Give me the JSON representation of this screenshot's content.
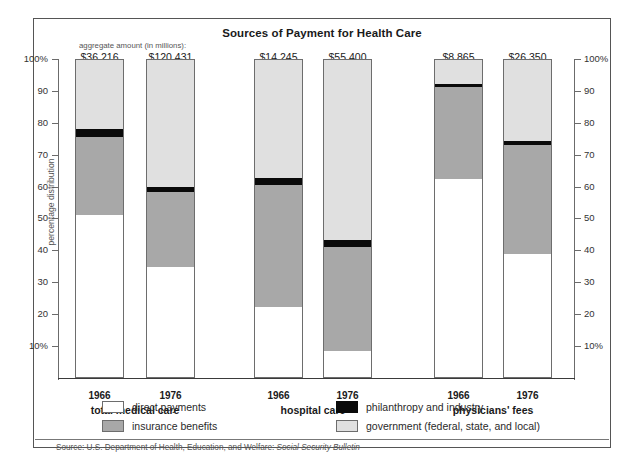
{
  "chart_data": {
    "type": "bar",
    "subtype": "stacked-percentage",
    "title": "Sources of Payment for Health Care",
    "xlabel": "",
    "ylabel": "percentage distribution",
    "ylim": [
      0,
      100
    ],
    "y_ticks": [
      "100%",
      "90",
      "80",
      "70",
      "60",
      "50",
      "40",
      "30",
      "20",
      "10%"
    ],
    "y_tick_values": [
      100,
      90,
      80,
      70,
      60,
      50,
      40,
      30,
      20,
      10
    ],
    "grid": false,
    "legend_position": "bottom",
    "aggregate_caption": "aggregate amount (in millions):",
    "series": [
      {
        "name": "direct payments",
        "color": "#ffffff",
        "values": [
          51.4,
          35.1,
          22.5,
          8.8,
          62.7,
          39.2
        ]
      },
      {
        "name": "insurance benefits",
        "color": "#a8a8a8",
        "values": [
          24.6,
          23.5,
          38.3,
          32.5,
          28.8,
          34.1
        ]
      },
      {
        "name": "philanthropy and industry",
        "color": "#0a0a0a",
        "values": [
          2.5,
          1.6,
          2.2,
          2.2,
          1.0,
          1.3
        ]
      },
      {
        "name": "government (federal, state, and local)",
        "color": "#e0e0e0",
        "values": [
          21.5,
          39.8,
          37.0,
          56.5,
          7.5,
          25.4
        ]
      }
    ],
    "categories": [
      "1966",
      "1976",
      "1966",
      "1976",
      "1966",
      "1976"
    ],
    "aggregate_amounts": [
      "$36,216",
      "$120,431",
      "$14,245",
      "$55,400",
      "$8,865",
      "$26,350"
    ],
    "groups": [
      {
        "label": "total medical care",
        "bars": [
          0,
          1
        ]
      },
      {
        "label": "hospital care",
        "bars": [
          2,
          3
        ]
      },
      {
        "label": "physicians' fees",
        "bars": [
          4,
          5
        ]
      }
    ],
    "annotations": {
      "source_prefix": "Source: U.S. Department of Health, Education, and Welfare: ",
      "source_italic": "Social Security Bulletin"
    }
  },
  "bars": [
    {
      "year": "1966",
      "aggregate": "$36,216",
      "direct_top": 51.4,
      "phil_bottom": 76.0,
      "phil_top": 78.5
    },
    {
      "year": "1976",
      "aggregate": "$120,431",
      "direct_top": 35.1,
      "phil_bottom": 58.6,
      "phil_top": 60.2
    },
    {
      "year": "1966",
      "aggregate": "$14,245",
      "direct_top": 22.5,
      "phil_bottom": 60.8,
      "phil_top": 63.0
    },
    {
      "year": "1976",
      "aggregate": "$55,400",
      "direct_top": 8.8,
      "phil_bottom": 41.3,
      "phil_top": 43.5
    },
    {
      "year": "1966",
      "aggregate": "$8,865",
      "direct_top": 62.7,
      "phil_bottom": 91.5,
      "phil_top": 92.5
    },
    {
      "year": "1976",
      "aggregate": "$26,350",
      "direct_top": 39.2,
      "phil_bottom": 73.3,
      "phil_top": 74.6
    }
  ],
  "groups": [
    {
      "label": "total medical care"
    },
    {
      "label": "hospital care"
    },
    {
      "label": "physicians' fees"
    }
  ],
  "legend": {
    "items": [
      {
        "key": "direct",
        "label": "direct payments"
      },
      {
        "key": "ins",
        "label": "insurance benefits"
      },
      {
        "key": "phil",
        "label": "philanthropy and industry"
      },
      {
        "key": "gov",
        "label": "government (federal, state, and local)"
      }
    ]
  },
  "axis": {
    "y_title": "percentage distribution",
    "ticks": [
      "100%",
      "90",
      "80",
      "70",
      "60",
      "50",
      "40",
      "30",
      "20",
      "10%"
    ]
  },
  "header": {
    "title": "Sources of Payment for Health Care",
    "aggregate_caption": "aggregate amount (in millions):"
  },
  "source": {
    "prefix": "Source: U.S. Department of Health, Education, and Welfare: ",
    "italic": "Social Security Bulletin"
  }
}
